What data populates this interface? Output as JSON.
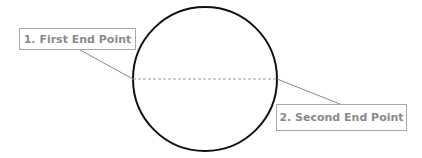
{
  "diagram": {
    "shape": "circle",
    "circle": {
      "cx": 205,
      "cy": 79,
      "r": 72,
      "stroke": "#111111"
    },
    "diameter_line": {
      "style": "dashed",
      "color": "#999999",
      "x1": 133,
      "x2": 277,
      "y": 79
    },
    "labels": [
      {
        "text": "1. First End Point",
        "points_to": "left end of diameter"
      },
      {
        "text": "2. Second End Point",
        "points_to": "right end of diameter"
      }
    ],
    "leader_color": "#8a8a8a",
    "label_text_color": "#8a8a8a",
    "label_border_color": "#a8a8a8"
  }
}
